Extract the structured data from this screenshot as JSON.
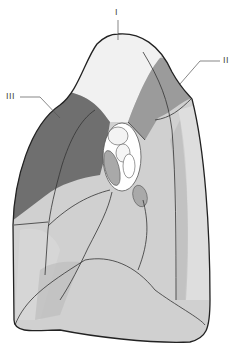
{
  "diagram": {
    "labels": [
      {
        "id": "I",
        "text": "I"
      },
      {
        "id": "II",
        "text": "II"
      },
      {
        "id": "III",
        "text": "III"
      }
    ],
    "colors": {
      "outline": "#2a2a2a",
      "segment_I": "#f1f1f1",
      "segment_II": "#9b9b9b",
      "segment_III": "#6f6f6f",
      "lower_lobes": "#cfcfcf",
      "lower_light": "#dcdcdc",
      "hilum_oval": "#a9a9a9",
      "hilum_bg": "#ffffff"
    }
  }
}
